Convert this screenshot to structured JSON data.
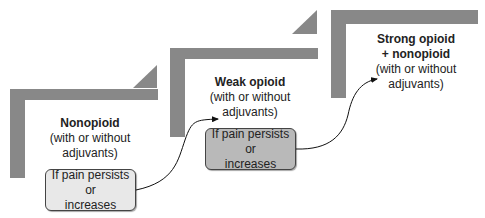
{
  "colors": {
    "step_bar": "#888888",
    "box1_fill": "#e8e8e8",
    "box2_fill": "#b9b9b9",
    "text": "#222222"
  },
  "steps": [
    {
      "title": "Nonopioid",
      "subtitle_lines": [
        "(with or without",
        "adjuvants)"
      ]
    },
    {
      "title": "Weak opioid",
      "subtitle_lines": [
        "(with or without",
        "adjuvants)"
      ]
    },
    {
      "title_lines": [
        "Strong opioid",
        "+ nonopioid"
      ],
      "subtitle_lines": [
        "(with or without adjuvants)"
      ]
    }
  ],
  "transitions": [
    {
      "lines": [
        "If pain persists or",
        "increases"
      ]
    },
    {
      "lines": [
        "If pain persists or",
        "increases"
      ]
    }
  ]
}
